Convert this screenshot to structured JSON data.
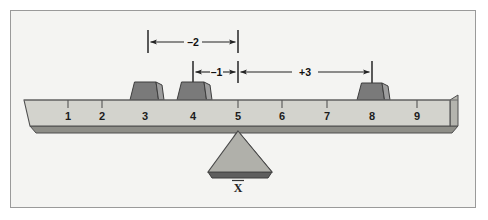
{
  "figure": {
    "frame_border_color": "#9a9a9a",
    "background_color": "#f4f4f2"
  },
  "colors": {
    "beam_face": "#d3d3cd",
    "beam_edge": "#5a5a5a",
    "beam_shadow": "#a6a6a0",
    "beam_end_cap": "#b4b4ae",
    "block_fill": "#7a7a7a",
    "block_side": "#9e9e9e",
    "block_edge": "#3d3d3d",
    "fulcrum_fill": "#b0b0aa",
    "fulcrum_shadow": "#5e5e5e",
    "line_color": "#222222",
    "text_color": "#1c1c1c"
  },
  "scale": {
    "label": "beam number line",
    "ticks": [
      {
        "value": 1,
        "label": "1",
        "x": 68
      },
      {
        "value": 2,
        "label": "2",
        "x": 102
      },
      {
        "value": 3,
        "label": "3",
        "x": 145
      },
      {
        "value": 4,
        "label": "4",
        "x": 193
      },
      {
        "value": 5,
        "label": "5",
        "x": 238
      },
      {
        "value": 6,
        "label": "6",
        "x": 282
      },
      {
        "value": 7,
        "label": "7",
        "x": 327
      },
      {
        "value": 8,
        "label": "8",
        "x": 372
      },
      {
        "value": 9,
        "label": "9",
        "x": 417
      }
    ]
  },
  "blocks": [
    {
      "name": "weight-block-3",
      "position": 3,
      "center_x": 145
    },
    {
      "name": "weight-block-4",
      "position": 4,
      "center_x": 193
    },
    {
      "name": "weight-block-8",
      "position": 8,
      "center_x": 372
    }
  ],
  "dimensions": [
    {
      "name": "deviation-minus-2",
      "label": "–2",
      "value": -2,
      "from_position": 3,
      "to_position": 5,
      "x_start": 148,
      "x_end": 238,
      "row_y": 42,
      "label_x": 193,
      "arrow_style": "inward"
    },
    {
      "name": "deviation-minus-1",
      "label": "–1",
      "value": -1,
      "from_position": 4,
      "to_position": 5,
      "x_start": 193,
      "x_end": 238,
      "row_y": 72,
      "label_x": 216,
      "arrow_style": "inward"
    },
    {
      "name": "deviation-plus-3",
      "label": "+3",
      "value": 3,
      "from_position": 5,
      "to_position": 8,
      "x_start": 238,
      "x_end": 372,
      "row_y": 72,
      "label_x": 305,
      "arrow_style": "inward"
    }
  ],
  "fulcrum": {
    "name": "fulcrum-triangle",
    "apex_x": 238,
    "apex_y": 131,
    "base_y": 172,
    "base_left_x": 208,
    "base_right_x": 272,
    "mean_label": "X",
    "mean_label_overbar": true,
    "mean_label_x": 238,
    "mean_label_y": 188,
    "balance_position": 5
  },
  "beam": {
    "name": "balance-beam",
    "left_x": 24,
    "right_x": 458,
    "top_y": 100,
    "bottom_y": 126,
    "label_baseline_y": 120
  }
}
